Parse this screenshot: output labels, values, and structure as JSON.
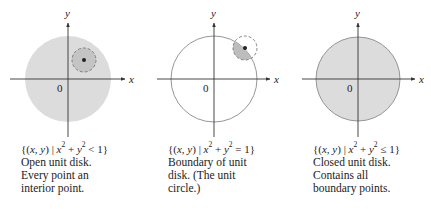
{
  "panels": [
    {
      "id": "open-disk",
      "axis_x_label": "x",
      "axis_y_label": "y",
      "origin_label": "0",
      "set_expr": {
        "open": "{(",
        "vars": "x, y",
        "close_vars": ")",
        "bar": " | ",
        "lhs_x": "x",
        "lhs_y": "y",
        "exp": "2",
        "plus": " + ",
        "rel": " < 1}"
      },
      "lines": [
        "Open unit disk.",
        "Every point an",
        "interior point."
      ],
      "disk_fill": "#dcdcdc",
      "boundary": "none",
      "neighborhood": "full-inside"
    },
    {
      "id": "unit-circle",
      "axis_x_label": "x",
      "axis_y_label": "y",
      "origin_label": "0",
      "set_expr": {
        "open": "{(",
        "vars": "x, y",
        "close_vars": ")",
        "bar": " | ",
        "lhs_x": "x",
        "lhs_y": "y",
        "exp": "2",
        "plus": " + ",
        "rel": " = 1}"
      },
      "lines": [
        "Boundary of unit",
        "disk. (The unit",
        "circle.)"
      ],
      "disk_fill": "none",
      "boundary": "solid",
      "neighborhood": "on-boundary"
    },
    {
      "id": "closed-disk",
      "axis_x_label": "x",
      "axis_y_label": "y",
      "origin_label": "0",
      "set_expr": {
        "open": "{(",
        "vars": "x, y",
        "close_vars": ")",
        "bar": " | ",
        "lhs_x": "x",
        "lhs_y": "y",
        "exp": "2",
        "plus": " + ",
        "rel": " ≤ 1}"
      },
      "lines": [
        "Closed unit disk.",
        "Contains all",
        "boundary points."
      ],
      "disk_fill": "#dcdcdc",
      "boundary": "solid",
      "neighborhood": "none"
    }
  ],
  "colors": {
    "axis": "#333333",
    "disk_fill": "#dcdcdc",
    "boundary": "#8a8a8a",
    "neighborhood_fill": "#bdbdbd",
    "neighborhood_stroke": "#777777",
    "point": "#222222"
  }
}
